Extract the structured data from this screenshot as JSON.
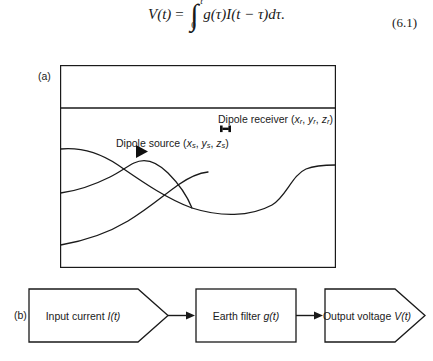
{
  "equation": {
    "lhs": "V(t)",
    "equals": "=",
    "integral_lower": "0",
    "integral_upper": "t",
    "integrand": "g(τ)I(t − τ)dτ.",
    "number": "(6.1)"
  },
  "panel_a": {
    "label": "(a)",
    "source": {
      "text_main": "Dipole source (",
      "var_x": "x",
      "sub_x": "s",
      "sep1": ", ",
      "var_y": "y",
      "sub_y": "s",
      "sep2": ", ",
      "var_z": "z",
      "sub_z": "s",
      "close": ")",
      "marker": "triangle-right-marker"
    },
    "receiver": {
      "text_main": "Dipole receiver (",
      "var_x": "x",
      "sub_x": "r",
      "sep1": ", ",
      "var_y": "y",
      "sub_y": "r",
      "sep2": ", ",
      "var_z": "z",
      "sub_z": "r",
      "close": ")",
      "marker": "dipole-dumbbell-marker"
    },
    "features": [
      "seafloor-interface-line",
      "subsurface-horizon-1",
      "subsurface-horizon-2",
      "subsurface-horizon-3"
    ]
  },
  "panel_b": {
    "label": "(b)",
    "nodes": [
      {
        "id": "input-current",
        "label": "Input current I(t)",
        "label_plain": "Input current ",
        "label_italic": "I(t)",
        "shape": "pentagon-right"
      },
      {
        "id": "earth-filter",
        "label": "Earth filter g(t)",
        "label_plain": "Earth filter ",
        "label_italic": "g(t)",
        "shape": "rectangle"
      },
      {
        "id": "output-voltage",
        "label": "Output voltage V(t)",
        "label_plain": "Output voltage ",
        "label_italic": "V(t)",
        "shape": "pentagon-right"
      }
    ],
    "connectors": [
      {
        "id": "arrow-input-to-filter",
        "icon": "arrow-right-icon"
      },
      {
        "id": "arrow-filter-to-output",
        "icon": "arrow-right-icon"
      }
    ]
  },
  "caption": {
    "text": ""
  },
  "colors": {
    "line": "#1a1a1a",
    "text": "#1a1a1a",
    "background": "#ffffff"
  }
}
